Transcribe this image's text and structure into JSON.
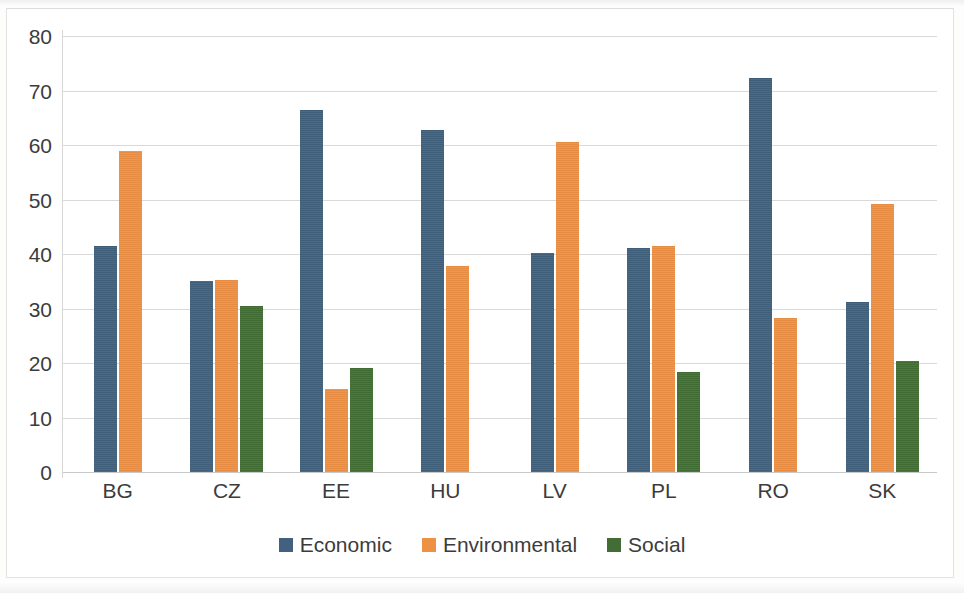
{
  "chart_data": {
    "type": "bar",
    "title": "",
    "subtitle": "",
    "xlabel": "",
    "ylabel": "",
    "categories": [
      "BG",
      "CZ",
      "EE",
      "HU",
      "LV",
      "PL",
      "RO",
      "SK"
    ],
    "series": [
      {
        "name": "Economic",
        "color": "#41617e",
        "values": [
          41.4,
          35.0,
          66.4,
          62.8,
          40.1,
          41.1,
          72.3,
          31.2
        ]
      },
      {
        "name": "Environmental",
        "color": "#ed9144",
        "values": [
          58.9,
          35.2,
          15.3,
          37.8,
          60.5,
          41.4,
          28.2,
          49.2
        ]
      },
      {
        "name": "Social",
        "color": "#426e35",
        "values": [
          0,
          30.4,
          19.0,
          0,
          0,
          18.4,
          0,
          20.3
        ]
      }
    ],
    "ylim": [
      0,
      80
    ],
    "y_ticks": [
      0,
      10,
      20,
      30,
      40,
      50,
      60,
      70,
      80
    ],
    "y_tick_labels": [
      "0",
      "10",
      "20",
      "30",
      "40",
      "50",
      "60",
      "70",
      "80"
    ],
    "grid": true,
    "grid_axis": "y",
    "legend_position": "bottom",
    "legend_entries": [
      "Economic",
      "Environmental",
      "Social"
    ]
  },
  "colors": {
    "economic": "#41617e",
    "environmental": "#ed9144",
    "social": "#426e35",
    "gridline": "#d9d9d9",
    "text": "#3c3c3c",
    "plot_background": "#ffffff"
  }
}
